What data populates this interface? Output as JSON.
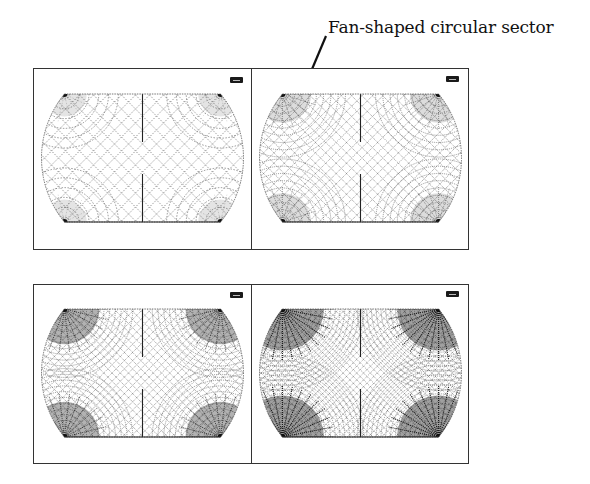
{
  "annotation": {
    "label": "Fan-shaped circular sector",
    "arrow_target": "top-right panel, upper-left corner"
  },
  "figure": {
    "rows": [
      {
        "panels": [
          {
            "id": "a",
            "mesh_density": 1,
            "corner_fan_darkness": 0.25,
            "badge": "small-toolbar-icon"
          },
          {
            "id": "b",
            "mesh_density": 2,
            "corner_fan_darkness": 0.5,
            "badge": "small-toolbar-icon"
          }
        ]
      },
      {
        "panels": [
          {
            "id": "c",
            "mesh_density": 3,
            "corner_fan_darkness": 0.75,
            "badge": "small-toolbar-icon"
          },
          {
            "id": "d",
            "mesh_density": 4,
            "corner_fan_darkness": 1.0,
            "badge": "small-toolbar-icon"
          }
        ]
      }
    ]
  },
  "colors": {
    "frame": "#333333",
    "mesh": "#555555",
    "fan": "#111111",
    "background": "#ffffff"
  }
}
